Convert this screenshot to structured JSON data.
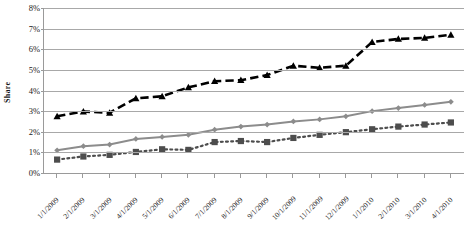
{
  "chart_data": {
    "type": "line",
    "title": "",
    "subtitle": "",
    "xlabel": "",
    "ylabel": "Share",
    "ylim": [
      0,
      8
    ],
    "ytick_labels": [
      "0%",
      "1%",
      "2%",
      "3%",
      "4%",
      "5%",
      "6%",
      "7%",
      "8%"
    ],
    "ytick_values": [
      0,
      1,
      2,
      3,
      4,
      5,
      6,
      7,
      8
    ],
    "grid": true,
    "legend": "none",
    "categories": [
      "1/1/2009",
      "2/1/2009",
      "3/1/2009",
      "4/1/2009",
      "5/1/2009",
      "6/1/2009",
      "7/1/2009",
      "8/1/2009",
      "9/1/2009",
      "10/1/2009",
      "11/1/2009",
      "12/1/2009",
      "1/1/2010",
      "2/1/2010",
      "3/1/2010",
      "4/1/2010"
    ],
    "series": [
      {
        "name": "series-triangle",
        "marker": "triangle",
        "color": "#000000",
        "line_style": "dashed",
        "values": [
          2.75,
          2.98,
          2.92,
          3.62,
          3.72,
          4.15,
          4.45,
          4.5,
          4.75,
          5.2,
          5.1,
          5.2,
          6.35,
          6.5,
          6.55,
          6.7
        ]
      },
      {
        "name": "series-diamond",
        "marker": "diamond",
        "color": "#8c8c8c",
        "line_style": "solid",
        "values": [
          1.1,
          1.3,
          1.38,
          1.65,
          1.75,
          1.85,
          2.1,
          2.25,
          2.35,
          2.5,
          2.6,
          2.75,
          3.0,
          3.15,
          3.3,
          3.45
        ]
      },
      {
        "name": "series-square",
        "marker": "square",
        "color": "#4d4d4d",
        "line_style": "dotted",
        "values": [
          0.65,
          0.8,
          0.88,
          1.02,
          1.15,
          1.12,
          1.5,
          1.55,
          1.5,
          1.7,
          1.85,
          1.98,
          2.12,
          2.25,
          2.35,
          2.45
        ]
      }
    ]
  }
}
